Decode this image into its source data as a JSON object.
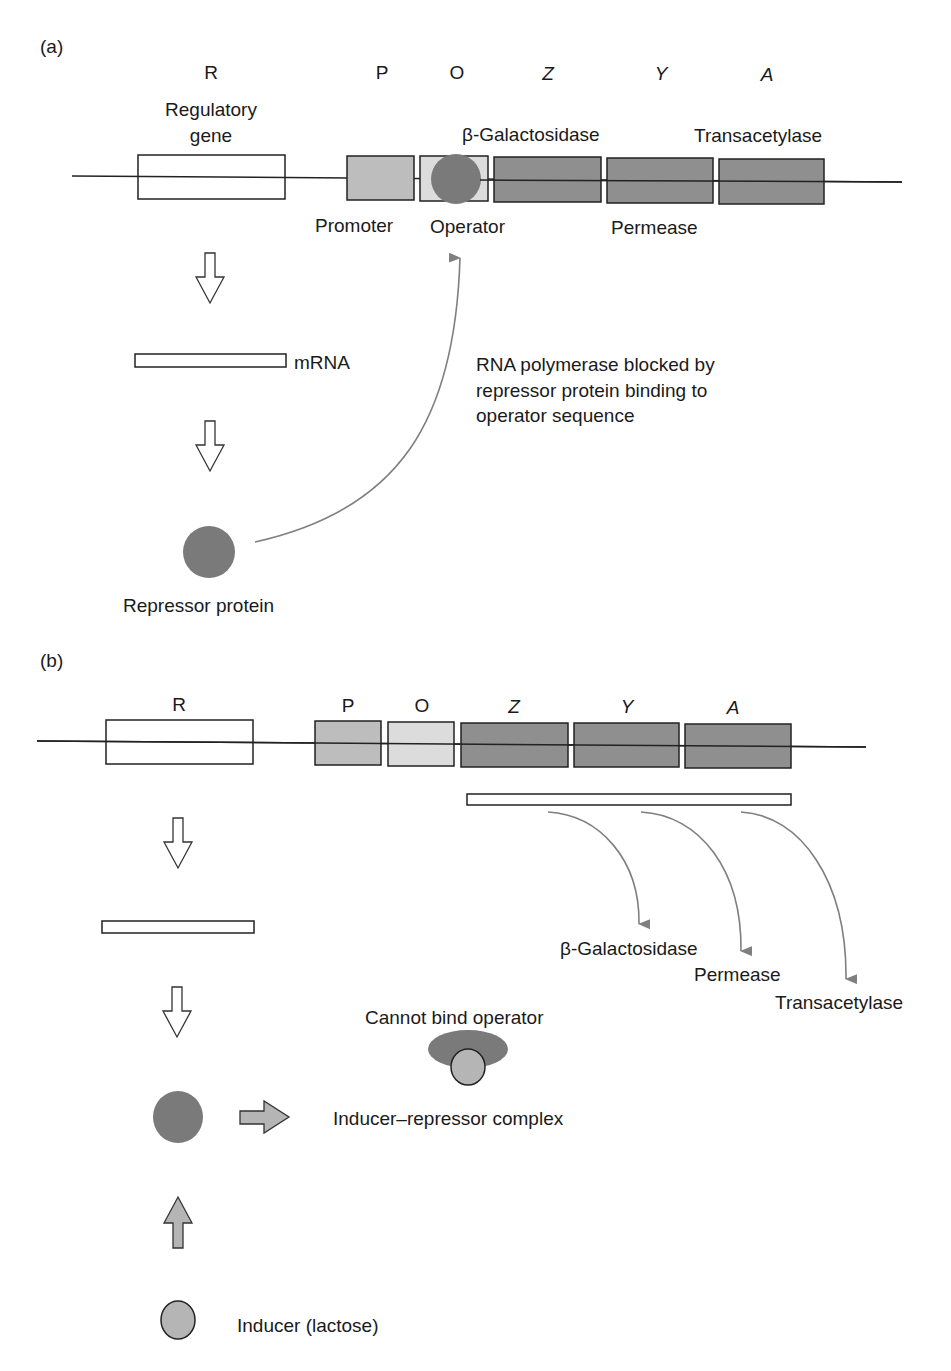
{
  "panel_a": {
    "label": "(a)",
    "gene_letters": {
      "R": "R",
      "P": "P",
      "O": "O",
      "Z": "Z",
      "Y": "Y",
      "A": "A"
    },
    "regulatory_gene_line1": "Regulatory",
    "regulatory_gene_line2": "gene",
    "beta_gal": "β-Galactosidase",
    "transacetylase": "Transacetylase",
    "promoter": "Promoter",
    "operator": "Operator",
    "permease": "Permease",
    "mrna": "mRNA",
    "blocked_line1": "RNA polymerase blocked by",
    "blocked_line2": "repressor protein binding to",
    "blocked_line3": "operator sequence",
    "repressor_protein": "Repressor protein"
  },
  "panel_b": {
    "label": "(b)",
    "gene_letters": {
      "R": "R",
      "P": "P",
      "O": "O",
      "Z": "Z",
      "Y": "Y",
      "A": "A"
    },
    "beta_gal": "β-Galactosidase",
    "permease": "Permease",
    "transacetylase": "Transacetylase",
    "cannot_bind": "Cannot bind operator",
    "complex": "Inducer–repressor complex",
    "inducer": "Inducer (lactose)"
  },
  "colors": {
    "dark_gene": "#8f8f8f",
    "promoter": "#bdbdbd",
    "operator": "#dcdcdc",
    "repressor": "#7a7a7a",
    "inducer": "#b5b5b5",
    "arrow_gray": "#7f7f7f"
  }
}
